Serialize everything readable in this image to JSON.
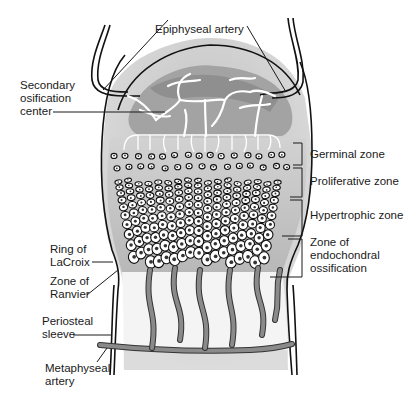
{
  "labels": {
    "epiphyseal_artery": "Epiphyseal artery",
    "secondary_ossification_line1": "Secondary",
    "secondary_ossification_line2": "osification",
    "secondary_ossification_line3": "center",
    "ring_of_lacroix_line1": "Ring of",
    "ring_of_lacroix_line2": "LaCroix",
    "zone_of_ranvier_line1": "Zone of",
    "zone_of_ranvier_line2": "Ranvier",
    "periosteal_sleeve_line1": "Periosteal",
    "periosteal_sleeve_line2": "sleeve",
    "metaphyseal_artery_line1": "Metaphyseal",
    "metaphyseal_artery_line2": "artery"
  },
  "zones": [
    {
      "name": "germinal",
      "label_lines": [
        "Germinal zone"
      ]
    },
    {
      "name": "proliferative",
      "label_lines": [
        "Proliferative zone"
      ]
    },
    {
      "name": "hypertrophic",
      "label_lines": [
        "Hypertrophic zone"
      ]
    },
    {
      "name": "endochondral",
      "label_lines": [
        "Zone of",
        "endochondral",
        "ossification"
      ]
    }
  ],
  "colors": {
    "cartilage_fill": "#c4c4c4",
    "ossification_center": "#9a9a9a",
    "bone_outline": "#111111",
    "vessel": "#8a8a8a"
  }
}
